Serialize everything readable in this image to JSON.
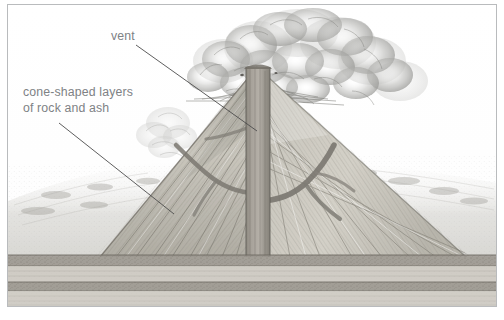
{
  "diagram": {
    "kind": "volcano-cross-section",
    "style": "pencil-shaded scientific illustration",
    "frame_color": "#b9bbbd",
    "background_color": "#ffffff",
    "label_color": "#7e8285",
    "labels": [
      {
        "id": "vent",
        "text": "vent",
        "x": 103,
        "y": 24,
        "leader": {
          "from_x": 135,
          "from_y": 44,
          "to_x": 249,
          "to_y": 126
        }
      },
      {
        "id": "cone-layers",
        "text": "cone-shaped layers\nof rock and ash",
        "line1": "cone-shaped layers",
        "line2": "of rock and ash",
        "x": 15,
        "y": 80,
        "leader": {
          "from_x": 58,
          "from_y": 122,
          "to_x": 166,
          "to_y": 209
        }
      }
    ],
    "parts": {
      "ash_cloud": "eruption ash and steam plume above summit",
      "central_conduit": "vertical magma pipe / vent",
      "side_dikes": "branching magma dikes in left and right flanks",
      "cone_strata": "alternating diagonal layers of rock and ash",
      "ground_strata": "horizontal sedimentary bedrock layers",
      "background_hills": "hazy distant terrain"
    },
    "palette": {
      "rock_light": "#d7d4cd",
      "rock_mid": "#b5b2a9",
      "rock_dark": "#8d8a82",
      "conduit": "#9a958c",
      "bedrock": "#a8a59c",
      "cloud": "#cfcfcd"
    }
  }
}
